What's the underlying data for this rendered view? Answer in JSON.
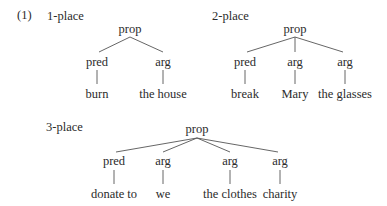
{
  "example_number": "(1)",
  "trees": [
    {
      "label": "1-place",
      "root": "prop",
      "children": [
        {
          "node": "pred",
          "leaf": "burn"
        },
        {
          "node": "arg",
          "leaf": "the house"
        }
      ]
    },
    {
      "label": "2-place",
      "root": "prop",
      "children": [
        {
          "node": "pred",
          "leaf": "break"
        },
        {
          "node": "arg",
          "leaf": "Mary"
        },
        {
          "node": "arg",
          "leaf": "the glasses"
        }
      ]
    },
    {
      "label": "3-place",
      "root": "prop",
      "children": [
        {
          "node": "pred",
          "leaf": "donate to"
        },
        {
          "node": "arg",
          "leaf": "we"
        },
        {
          "node": "arg",
          "leaf": "the clothes"
        },
        {
          "node": "arg",
          "leaf": "charity"
        }
      ]
    }
  ]
}
